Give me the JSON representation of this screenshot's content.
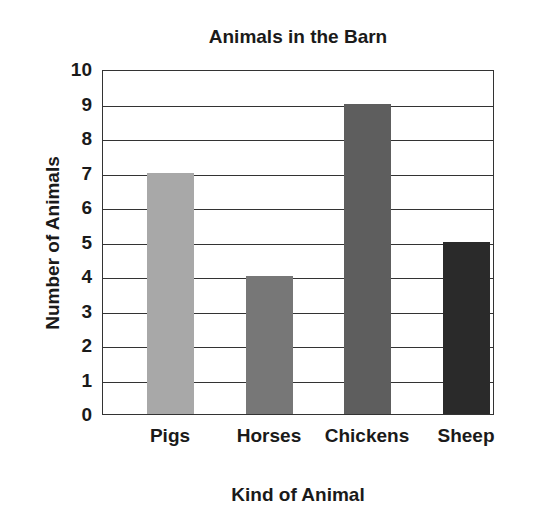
{
  "chart_data": {
    "type": "bar",
    "title": "Animals in the Barn",
    "xlabel": "Kind of Animal",
    "ylabel": "Number of Animals",
    "categories": [
      "Pigs",
      "Horses",
      "Chickens",
      "Sheep"
    ],
    "values": [
      7,
      4,
      9,
      5
    ],
    "colors": [
      "#a8a8a8",
      "#777777",
      "#5e5e5e",
      "#2a2a2a"
    ],
    "ylim": [
      0,
      10
    ],
    "yticks": [
      "0",
      "1",
      "2",
      "3",
      "4",
      "5",
      "6",
      "7",
      "8",
      "9",
      "10"
    ],
    "grid": true,
    "legend": null
  }
}
